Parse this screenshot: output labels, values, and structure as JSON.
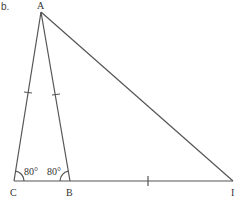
{
  "part_label": "b.",
  "vertices": {
    "A": {
      "label": "A",
      "x": 41,
      "y": 12
    },
    "B": {
      "label": "B",
      "x": 70,
      "y": 181
    },
    "C": {
      "label": "C",
      "x": 14,
      "y": 181
    },
    "I": {
      "label": "I",
      "x": 233,
      "y": 181
    }
  },
  "angles": {
    "C": {
      "label": "80°"
    },
    "B": {
      "label": "80°"
    }
  },
  "colors": {
    "stroke": "#555555",
    "text": "#333333"
  }
}
